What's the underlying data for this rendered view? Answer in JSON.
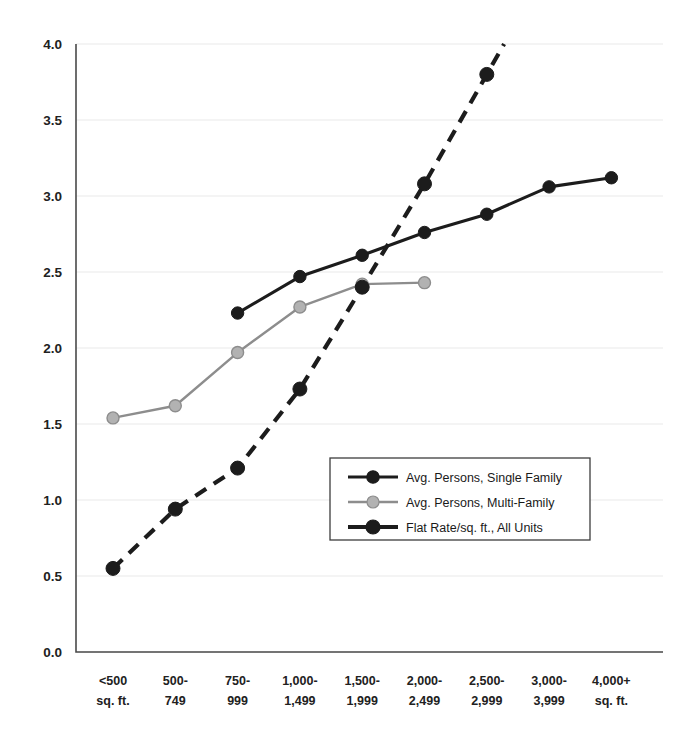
{
  "chart_data": {
    "type": "line",
    "title": "",
    "subtitle": "",
    "xlabel": "",
    "ylabel": "",
    "ylim": [
      0.0,
      4.0
    ],
    "grid": true,
    "legend_position": "center-right-inside",
    "categories": [
      "<500\nsq. ft.",
      "500-\n749",
      "750-\n999",
      "1,000-\n1,499",
      "1,500-\n1,999",
      "2,000-\n2,499",
      "2,500-\n2,999",
      "3,000-\n3,999",
      "4,000+\nsq. ft."
    ],
    "category_lines": [
      [
        "<500",
        "sq. ft."
      ],
      [
        "500-",
        "749"
      ],
      [
        "750-",
        "999"
      ],
      [
        "1,000-",
        "1,499"
      ],
      [
        "1,500-",
        "1,999"
      ],
      [
        "2,000-",
        "2,499"
      ],
      [
        "2,500-",
        "2,999"
      ],
      [
        "3,000-",
        "3,999"
      ],
      [
        "4,000+",
        "sq. ft."
      ]
    ],
    "yticks": [
      "0.0",
      "0.5",
      "1.0",
      "1.5",
      "2.0",
      "2.5",
      "3.0",
      "3.5",
      "4.0"
    ],
    "ytick_values": [
      0.0,
      0.5,
      1.0,
      1.5,
      2.0,
      2.5,
      3.0,
      3.5,
      4.0
    ],
    "series": [
      {
        "name": "Avg. Persons, Single Family",
        "style": "solid",
        "color": "#1c1c1c",
        "marker": "circle",
        "values": [
          null,
          null,
          2.23,
          2.47,
          2.61,
          2.76,
          2.88,
          3.06,
          3.12
        ]
      },
      {
        "name": "Avg. Persons, Multi-Family",
        "style": "solid",
        "color": "#8d8d8d",
        "marker": "circle",
        "values": [
          1.54,
          1.62,
          1.97,
          2.27,
          2.42,
          2.43,
          null,
          null,
          null
        ]
      },
      {
        "name": "Flat Rate/sq. ft., All Units",
        "style": "dashed",
        "color": "#1c1c1c",
        "marker": "circle",
        "values": [
          0.55,
          0.94,
          1.21,
          1.73,
          2.4,
          3.08,
          3.8,
          null,
          null
        ],
        "extends_beyond_top": true
      }
    ]
  },
  "legend": {
    "entries": [
      {
        "label": "Avg. Persons, Single Family",
        "color": "#1c1c1c",
        "style": "solid"
      },
      {
        "label": "Avg. Persons, Multi-Family",
        "color": "#8d8d8d",
        "style": "solid"
      },
      {
        "label": "Flat Rate/sq. ft., All Units",
        "color": "#1c1c1c",
        "style": "solid-thick"
      }
    ]
  }
}
